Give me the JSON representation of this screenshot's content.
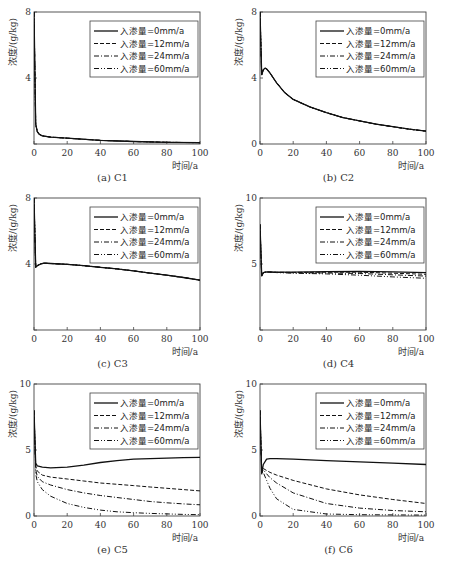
{
  "chart_data": [
    {
      "id": "a",
      "type": "line",
      "caption": "(a) C1",
      "title": "C1",
      "xlabel": "时间/a",
      "ylabel": "浓度/(g/kg)",
      "xlim": [
        0,
        100
      ],
      "ylim": [
        0,
        8
      ],
      "xticks": [
        0,
        20,
        40,
        60,
        80,
        100
      ],
      "yticks": [
        0,
        4,
        8
      ],
      "ytick_labels": [
        "",
        "4",
        "8"
      ],
      "legend_position": "upper right",
      "x": [
        0,
        1,
        2,
        3,
        5,
        10,
        20,
        40,
        60,
        80,
        100
      ],
      "series": [
        {
          "name": "入渗量=0mm/a",
          "style": "solid",
          "values": [
            8,
            1.2,
            0.75,
            0.6,
            0.5,
            0.42,
            0.35,
            0.22,
            0.15,
            0.1,
            0.08
          ]
        },
        {
          "name": "入渗量=12mm/a",
          "style": "dashed",
          "values": [
            8,
            1.2,
            0.75,
            0.6,
            0.5,
            0.42,
            0.35,
            0.22,
            0.15,
            0.1,
            0.08
          ]
        },
        {
          "name": "入渗量=24mm/a",
          "style": "dashdot",
          "values": [
            8,
            1.2,
            0.75,
            0.6,
            0.5,
            0.42,
            0.35,
            0.22,
            0.15,
            0.1,
            0.08
          ]
        },
        {
          "name": "入渗量=60mm/a",
          "style": "dashdotdot",
          "values": [
            8,
            1.2,
            0.75,
            0.6,
            0.5,
            0.42,
            0.35,
            0.22,
            0.15,
            0.1,
            0.08
          ]
        }
      ]
    },
    {
      "id": "b",
      "type": "line",
      "caption": "(b) C2",
      "title": "C2",
      "xlabel": "时间/a",
      "ylabel": "浓度/(g/kg)",
      "xlim": [
        0,
        100
      ],
      "ylim": [
        0,
        8
      ],
      "xticks": [
        0,
        20,
        40,
        60,
        80,
        100
      ],
      "yticks": [
        0,
        4,
        8
      ],
      "ytick_labels": [
        "0",
        "4",
        "8"
      ],
      "legend_position": "upper right",
      "x": [
        0,
        1,
        2,
        3,
        4,
        6,
        10,
        15,
        20,
        30,
        40,
        50,
        60,
        70,
        80,
        90,
        100
      ],
      "series": [
        {
          "name": "入渗量=0mm/a",
          "style": "solid",
          "values": [
            8,
            4.2,
            4.5,
            4.6,
            4.55,
            4.3,
            3.7,
            3.1,
            2.7,
            2.25,
            1.9,
            1.6,
            1.4,
            1.2,
            1.05,
            0.9,
            0.78
          ]
        },
        {
          "name": "入渗量=12mm/a",
          "style": "dashed",
          "values": [
            8,
            4.2,
            4.5,
            4.6,
            4.55,
            4.3,
            3.7,
            3.1,
            2.7,
            2.25,
            1.9,
            1.6,
            1.4,
            1.2,
            1.05,
            0.9,
            0.78
          ]
        },
        {
          "name": "入渗量=24mm/a",
          "style": "dashdot",
          "values": [
            8,
            4.2,
            4.5,
            4.6,
            4.55,
            4.3,
            3.7,
            3.1,
            2.7,
            2.25,
            1.9,
            1.6,
            1.4,
            1.2,
            1.05,
            0.9,
            0.78
          ]
        },
        {
          "name": "入渗量=60mm/a",
          "style": "dashdotdot",
          "values": [
            8,
            4.2,
            4.5,
            4.6,
            4.55,
            4.3,
            3.7,
            3.1,
            2.7,
            2.25,
            1.9,
            1.6,
            1.4,
            1.2,
            1.05,
            0.9,
            0.78
          ]
        }
      ]
    },
    {
      "id": "c",
      "type": "line",
      "caption": "(c) C3",
      "title": "C3",
      "xlabel": "时间/a",
      "ylabel": "浓度/(g/kg)",
      "xlim": [
        0,
        100
      ],
      "ylim": [
        0,
        8
      ],
      "xticks": [
        0,
        20,
        40,
        60,
        80,
        100
      ],
      "yticks": [
        0,
        4,
        8
      ],
      "ytick_labels": [
        "",
        "4",
        "8"
      ],
      "legend_position": "upper right",
      "x": [
        0,
        1,
        2,
        4,
        6,
        10,
        20,
        30,
        40,
        50,
        60,
        70,
        80,
        90,
        100
      ],
      "series": [
        {
          "name": "入渗量=0mm/a",
          "style": "solid",
          "values": [
            8,
            3.8,
            3.9,
            4.0,
            4.05,
            4.03,
            3.98,
            3.9,
            3.8,
            3.7,
            3.58,
            3.45,
            3.32,
            3.18,
            3.02
          ]
        },
        {
          "name": "入渗量=12mm/a",
          "style": "dashed",
          "values": [
            8,
            3.8,
            3.9,
            4.0,
            4.05,
            4.03,
            3.98,
            3.9,
            3.8,
            3.7,
            3.58,
            3.45,
            3.32,
            3.18,
            3.02
          ]
        },
        {
          "name": "入渗量=24mm/a",
          "style": "dashdot",
          "values": [
            8,
            3.8,
            3.9,
            4.0,
            4.05,
            4.03,
            3.98,
            3.9,
            3.8,
            3.7,
            3.58,
            3.45,
            3.32,
            3.18,
            3.02
          ]
        },
        {
          "name": "入渗量=60mm/a",
          "style": "dashdotdot",
          "values": [
            8,
            3.8,
            3.9,
            4.0,
            4.05,
            4.03,
            3.98,
            3.9,
            3.8,
            3.7,
            3.58,
            3.45,
            3.32,
            3.18,
            3.02
          ]
        }
      ]
    },
    {
      "id": "d",
      "type": "line",
      "caption": "(d) C4",
      "title": "C4",
      "xlabel": "时间/a",
      "ylabel": "浓度/(g/kg)",
      "xlim": [
        0,
        100
      ],
      "ylim": [
        0,
        10
      ],
      "xticks": [
        0,
        20,
        40,
        60,
        80,
        100
      ],
      "yticks": [
        0,
        5,
        10
      ],
      "ytick_labels": [
        "",
        "5",
        "10"
      ],
      "legend_position": "upper right",
      "x": [
        0,
        1,
        2,
        4,
        10,
        20,
        40,
        60,
        80,
        100
      ],
      "series": [
        {
          "name": "入渗量=0mm/a",
          "style": "solid",
          "values": [
            8,
            4.1,
            4.35,
            4.4,
            4.38,
            4.38,
            4.42,
            4.45,
            4.4,
            4.35
          ]
        },
        {
          "name": "入渗量=12mm/a",
          "style": "dashed",
          "values": [
            8,
            4.1,
            4.35,
            4.4,
            4.37,
            4.36,
            4.38,
            4.38,
            4.3,
            4.22
          ]
        },
        {
          "name": "入渗量=24mm/a",
          "style": "dashdot",
          "values": [
            8,
            4.1,
            4.35,
            4.4,
            4.36,
            4.33,
            4.32,
            4.28,
            4.18,
            4.08
          ]
        },
        {
          "name": "入渗量=60mm/a",
          "style": "dashdotdot",
          "values": [
            8,
            4.1,
            4.35,
            4.4,
            4.35,
            4.3,
            4.25,
            4.15,
            4.02,
            3.92
          ]
        }
      ]
    },
    {
      "id": "e",
      "type": "line",
      "caption": "(e) C5",
      "title": "C5",
      "xlabel": "时间/a",
      "ylabel": "浓度/(g/kg)",
      "xlim": [
        0,
        100
      ],
      "ylim": [
        0,
        10
      ],
      "xticks": [
        0,
        20,
        40,
        60,
        80,
        100
      ],
      "yticks": [
        0,
        5,
        10
      ],
      "ytick_labels": [
        "0",
        "5",
        "10"
      ],
      "legend_position": "upper right",
      "x": [
        0,
        1,
        2,
        5,
        10,
        20,
        30,
        40,
        50,
        60,
        70,
        80,
        90,
        100
      ],
      "series": [
        {
          "name": "入渗量=0mm/a",
          "style": "solid",
          "values": [
            8,
            4.0,
            3.8,
            3.7,
            3.65,
            3.7,
            3.85,
            4.05,
            4.2,
            4.3,
            4.35,
            4.38,
            4.42,
            4.45
          ]
        },
        {
          "name": "入渗量=12mm/a",
          "style": "dashed",
          "values": [
            8,
            3.8,
            3.4,
            3.1,
            2.95,
            2.8,
            2.65,
            2.5,
            2.4,
            2.3,
            2.2,
            2.1,
            2.0,
            1.9
          ]
        },
        {
          "name": "入渗量=24mm/a",
          "style": "dashdot",
          "values": [
            8,
            3.5,
            3.0,
            2.6,
            2.35,
            2.0,
            1.75,
            1.55,
            1.4,
            1.25,
            1.1,
            1.0,
            0.92,
            0.85
          ]
        },
        {
          "name": "入渗量=60mm/a",
          "style": "dashdotdot",
          "values": [
            8,
            3.2,
            2.6,
            2.0,
            1.5,
            0.95,
            0.65,
            0.45,
            0.32,
            0.25,
            0.2,
            0.16,
            0.12,
            0.1
          ]
        }
      ]
    },
    {
      "id": "f",
      "type": "line",
      "caption": "(f) C6",
      "title": "C6",
      "xlabel": "时间/a",
      "ylabel": "浓度/(g/kg)",
      "xlim": [
        0,
        100
      ],
      "ylim": [
        0,
        10
      ],
      "xticks": [
        0,
        20,
        40,
        60,
        80,
        100
      ],
      "yticks": [
        0,
        5,
        10
      ],
      "ytick_labels": [
        "0",
        "5",
        "10"
      ],
      "legend_position": "upper right",
      "x": [
        0,
        1,
        2,
        4,
        6,
        10,
        20,
        40,
        60,
        80,
        100
      ],
      "series": [
        {
          "name": "入渗量=0mm/a",
          "style": "solid",
          "values": [
            8,
            3.2,
            3.9,
            4.3,
            4.35,
            4.35,
            4.3,
            4.2,
            4.1,
            4.0,
            3.9
          ]
        },
        {
          "name": "入渗量=12mm/a",
          "style": "dashed",
          "values": [
            8,
            3.3,
            3.6,
            3.45,
            3.3,
            3.1,
            2.7,
            2.05,
            1.6,
            1.25,
            0.95
          ]
        },
        {
          "name": "入渗量=24mm/a",
          "style": "dashdot",
          "values": [
            8,
            3.3,
            3.5,
            3.2,
            2.9,
            2.5,
            1.75,
            0.95,
            0.6,
            0.42,
            0.32
          ]
        },
        {
          "name": "入渗量=60mm/a",
          "style": "dashdotdot",
          "values": [
            8,
            3.3,
            3.3,
            2.7,
            2.1,
            1.3,
            0.5,
            0.15,
            0.1,
            0.08,
            0.07
          ]
        }
      ]
    }
  ]
}
